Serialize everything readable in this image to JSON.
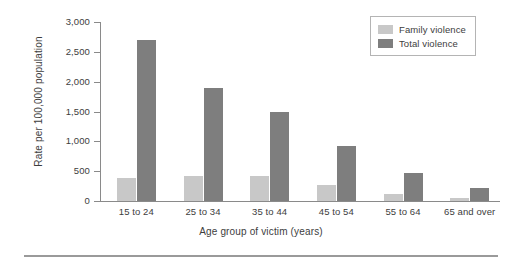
{
  "chart_data": {
    "type": "bar",
    "title": "",
    "xlabel": "Age group of victim (years)",
    "ylabel": "Rate per 100,000 population",
    "categories": [
      "15 to 24",
      "25 to 34",
      "35 to 44",
      "45 to 54",
      "55 to 64",
      "65 and over"
    ],
    "series": [
      {
        "name": "Family violence",
        "color": "#c8c8c8",
        "values": [
          390,
          420,
          425,
          275,
          120,
          45
        ]
      },
      {
        "name": "Total violence",
        "color": "#7e7e7e",
        "values": [
          2700,
          1900,
          1500,
          930,
          465,
          210
        ]
      }
    ],
    "ylim": [
      0,
      3000
    ],
    "yticks": [
      "0",
      "500",
      "1,000",
      "1,500",
      "2,000",
      "2,500",
      "3,000"
    ],
    "ytick_values": [
      0,
      500,
      1000,
      1500,
      2000,
      2500,
      3000
    ],
    "grid": false,
    "legend_position": "top-right"
  },
  "legend": {
    "items": [
      {
        "label": "Family violence",
        "color": "#c8c8c8"
      },
      {
        "label": "Total violence",
        "color": "#7e7e7e"
      }
    ]
  },
  "axes": {
    "y_title": "Rate per 100,000 population",
    "x_title": "Age group of victim (years)"
  }
}
